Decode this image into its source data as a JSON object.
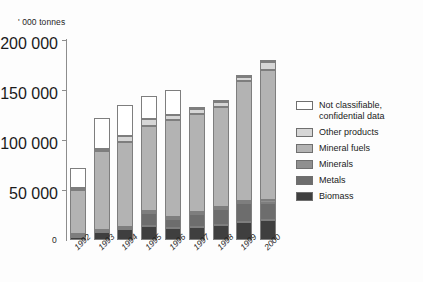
{
  "chart_data": {
    "type": "bar",
    "subtype": "stacked-bar",
    "title": "",
    "subtitle": "",
    "xlabel": "",
    "ylabel": "' 000 tonnes",
    "unit_caption": "' 000 tonnes",
    "categories": [
      "1992",
      "1993",
      "1994",
      "1995",
      "1996",
      "1997",
      "1998",
      "1999",
      "2000"
    ],
    "ylim": [
      0,
      200000
    ],
    "ytick_values": [
      0,
      50000,
      100000,
      150000,
      200000
    ],
    "ytick_labels": [
      "0",
      "50 000",
      "100 000",
      "150 000",
      "200 000"
    ],
    "grid": false,
    "legend_position": "right",
    "stack_order_bottom_to_top": [
      "Biomass",
      "Metals",
      "Minerals",
      "Mineral fuels",
      "Other products",
      "Not classifiable, confidential data"
    ],
    "series": [
      {
        "name": "Biomass",
        "color": "#3f3f3f",
        "values": [
          3000,
          8000,
          11000,
          14000,
          12000,
          13000,
          15000,
          18000,
          20000
        ]
      },
      {
        "name": "Metals",
        "color": "#6d6d6d",
        "values": [
          2000,
          1000,
          1000,
          13000,
          9000,
          13000,
          16000,
          19000,
          17000
        ]
      },
      {
        "name": "Minerals",
        "color": "#8f8f8f",
        "values": [
          1000,
          1000,
          1000,
          2000,
          2000,
          2000,
          2000,
          2000,
          3000
        ]
      },
      {
        "name": "Mineral fuels",
        "color": "#b3b3b3",
        "values": [
          44000,
          79000,
          85000,
          85000,
          97000,
          98000,
          100000,
          120000,
          130000
        ]
      },
      {
        "name": "Other products",
        "color": "#d6d6d6",
        "values": [
          2000,
          2000,
          6000,
          7000,
          5000,
          5000,
          5000,
          4000,
          8000
        ]
      },
      {
        "name": "Not classifiable, confidential data",
        "color": "#ffffff",
        "values": [
          20000,
          31000,
          31000,
          23000,
          25000,
          1000,
          1000,
          2000,
          1000
        ]
      }
    ],
    "totals": [
      72000,
      122000,
      135000,
      144000,
      150000,
      132000,
      139000,
      165000,
      179000
    ]
  },
  "legend": {
    "items": [
      {
        "label": "Not classifiable,\nconfidential data",
        "color": "#ffffff"
      },
      {
        "label": "Other products",
        "color": "#d6d6d6"
      },
      {
        "label": "Mineral fuels",
        "color": "#b3b3b3"
      },
      {
        "label": "Minerals",
        "color": "#8f8f8f"
      },
      {
        "label": "Metals",
        "color": "#6d6d6d"
      },
      {
        "label": "Biomass",
        "color": "#3f3f3f"
      }
    ]
  },
  "axis": {
    "zero_label": "0"
  }
}
